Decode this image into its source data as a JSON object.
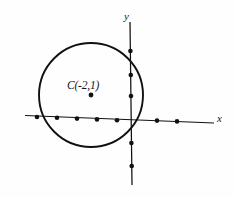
{
  "figure": {
    "kind": "coordinate-plane-with-circle",
    "background_color": "#fefefe",
    "ink_color": "#111111",
    "axes": {
      "x_label": "x",
      "y_label": "y",
      "origin_px": [
        131,
        119
      ],
      "unit_px": 20,
      "x_axis_from_px": [
        25,
        116
      ],
      "x_axis_to_px": [
        214,
        123
      ],
      "y_axis_from_px": [
        130,
        22
      ],
      "y_axis_to_px": [
        132,
        185
      ]
    },
    "circle": {
      "center_label": "C(-2,1)",
      "center_point": [
        -2,
        1
      ],
      "center_px": [
        91,
        95
      ],
      "radius_units": 2.6,
      "radius_px": 52,
      "stroke_width_px": 1.8
    },
    "marked_points": {
      "on_x_axis": [
        {
          "coords": [
            -5,
            0
          ],
          "px": [
            37,
            117
          ]
        },
        {
          "coords": [
            -4,
            0
          ],
          "px": [
            57,
            118
          ]
        },
        {
          "coords": [
            -3,
            0
          ],
          "px": [
            77,
            118
          ]
        },
        {
          "coords": [
            -2,
            0
          ],
          "px": [
            97,
            119
          ]
        },
        {
          "coords": [
            -1,
            0
          ],
          "px": [
            117,
            119
          ]
        },
        {
          "coords": [
            1,
            0
          ],
          "px": [
            157,
            120
          ]
        },
        {
          "coords": [
            2,
            0
          ],
          "px": [
            177,
            121
          ]
        }
      ],
      "on_y_axis": [
        {
          "coords": [
            0,
            3
          ],
          "px": [
            131,
            51
          ]
        },
        {
          "coords": [
            0,
            2
          ],
          "px": [
            131,
            75
          ]
        },
        {
          "coords": [
            0,
            1
          ],
          "px": [
            131,
            96
          ]
        },
        {
          "coords": [
            0,
            -1
          ],
          "px": [
            131,
            143
          ]
        },
        {
          "coords": [
            0,
            -2
          ],
          "px": [
            131,
            166
          ]
        }
      ],
      "center_dot": {
        "coords": [
          -2,
          1
        ],
        "px": [
          91,
          95
        ]
      }
    },
    "dot_radius_px": 2.3
  }
}
